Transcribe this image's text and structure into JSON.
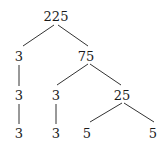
{
  "diagram": {
    "type": "factor-tree",
    "root": "225",
    "nodes": [
      {
        "id": "n225",
        "label": "225",
        "x": 56,
        "y": 16
      },
      {
        "id": "n3a",
        "label": "3",
        "x": 19,
        "y": 56
      },
      {
        "id": "n75",
        "label": "75",
        "x": 86,
        "y": 56
      },
      {
        "id": "n3b",
        "label": "3",
        "x": 19,
        "y": 95
      },
      {
        "id": "n3c",
        "label": "3",
        "x": 56,
        "y": 95
      },
      {
        "id": "n25",
        "label": "25",
        "x": 122,
        "y": 95
      },
      {
        "id": "n3d",
        "label": "3",
        "x": 19,
        "y": 133
      },
      {
        "id": "n3e",
        "label": "3",
        "x": 56,
        "y": 133
      },
      {
        "id": "n5a",
        "label": "5",
        "x": 87,
        "y": 133
      },
      {
        "id": "n5b",
        "label": "5",
        "x": 153,
        "y": 133
      }
    ],
    "edges": [
      [
        "n225",
        "n3a"
      ],
      [
        "n225",
        "n75"
      ],
      [
        "n3a",
        "n3b"
      ],
      [
        "n75",
        "n3c"
      ],
      [
        "n75",
        "n25"
      ],
      [
        "n3b",
        "n3d"
      ],
      [
        "n3c",
        "n3e"
      ],
      [
        "n25",
        "n5a"
      ],
      [
        "n25",
        "n5b"
      ]
    ],
    "line_color": "#333333"
  }
}
